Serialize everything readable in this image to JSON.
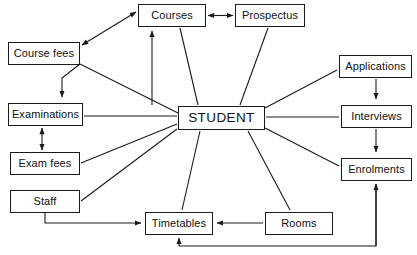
{
  "diagram": {
    "type": "context-diagram",
    "canvas": {
      "width": 417,
      "height": 255
    },
    "style": {
      "background": "#ffffff",
      "box_border_color": "#1a1a1a",
      "box_fill": "#ffffff",
      "line_color": "#1a1a1a",
      "text_color": "#111111"
    },
    "nodes": [
      {
        "id": "courses",
        "label": "Courses",
        "x": 138,
        "y": 4,
        "w": 68,
        "h": 23
      },
      {
        "id": "prospectus",
        "label": "Prospectus",
        "x": 235,
        "y": 4,
        "w": 70,
        "h": 23
      },
      {
        "id": "course_fees",
        "label": "Course fees",
        "x": 8,
        "y": 42,
        "w": 72,
        "h": 23
      },
      {
        "id": "applications",
        "label": "Applications",
        "x": 339,
        "y": 55,
        "w": 73,
        "h": 23
      },
      {
        "id": "examinations",
        "label": "Examinations",
        "x": 8,
        "y": 103,
        "w": 75,
        "h": 23
      },
      {
        "id": "student",
        "label": "STUDENT",
        "x": 178,
        "y": 106,
        "w": 87,
        "h": 24
      },
      {
        "id": "interviews",
        "label": "Interviews",
        "x": 341,
        "y": 105,
        "w": 71,
        "h": 23
      },
      {
        "id": "exam_fees",
        "label": "Exam fees",
        "x": 10,
        "y": 152,
        "w": 70,
        "h": 23
      },
      {
        "id": "enrolments",
        "label": "Enrolments",
        "x": 341,
        "y": 158,
        "w": 71,
        "h": 23
      },
      {
        "id": "staff",
        "label": "Staff",
        "x": 10,
        "y": 190,
        "w": 70,
        "h": 23
      },
      {
        "id": "timetables",
        "label": "Timetables",
        "x": 145,
        "y": 212,
        "w": 68,
        "h": 23
      },
      {
        "id": "rooms",
        "label": "Rooms",
        "x": 265,
        "y": 212,
        "w": 68,
        "h": 23
      }
    ],
    "edges": [
      {
        "id": "courses-prospectus",
        "from": "courses",
        "to": "prospectus",
        "arrow": "both"
      },
      {
        "id": "coursefees-courses",
        "from": "course_fees",
        "to": "courses",
        "arrow": "both"
      },
      {
        "id": "courses-examinations",
        "from": "courses",
        "to": "examinations",
        "arrow": "to"
      },
      {
        "id": "student-courses",
        "from": "student",
        "to": "courses",
        "arrow": "to"
      },
      {
        "id": "student-coursefees",
        "from": "student",
        "to": "course_fees",
        "arrow": "none"
      },
      {
        "id": "student-prospectus",
        "from": "student",
        "to": "prospectus",
        "arrow": "none"
      },
      {
        "id": "student-applications",
        "from": "student",
        "to": "applications",
        "arrow": "none"
      },
      {
        "id": "applications-interviews",
        "from": "applications",
        "to": "interviews",
        "arrow": "to"
      },
      {
        "id": "student-interviews",
        "from": "student",
        "to": "interviews",
        "arrow": "none"
      },
      {
        "id": "interviews-enrolments",
        "from": "interviews",
        "to": "enrolments",
        "arrow": "to"
      },
      {
        "id": "student-enrolments",
        "from": "student",
        "to": "enrolments",
        "arrow": "none"
      },
      {
        "id": "student-examinations",
        "from": "student",
        "to": "examinations",
        "arrow": "none"
      },
      {
        "id": "examinations-examfees",
        "from": "examinations",
        "to": "exam_fees",
        "arrow": "both"
      },
      {
        "id": "student-examfees",
        "from": "student",
        "to": "exam_fees",
        "arrow": "none"
      },
      {
        "id": "student-staff",
        "from": "student",
        "to": "staff",
        "arrow": "none"
      },
      {
        "id": "staff-timetables",
        "from": "staff",
        "to": "timetables",
        "arrow": "to"
      },
      {
        "id": "student-timetables",
        "from": "student",
        "to": "timetables",
        "arrow": "none"
      },
      {
        "id": "student-rooms",
        "from": "student",
        "to": "rooms",
        "arrow": "none"
      },
      {
        "id": "rooms-timetables",
        "from": "rooms",
        "to": "timetables",
        "arrow": "to"
      },
      {
        "id": "timetables-enrolments",
        "from": "timetables",
        "to": "enrolments",
        "arrow": "to"
      }
    ]
  }
}
